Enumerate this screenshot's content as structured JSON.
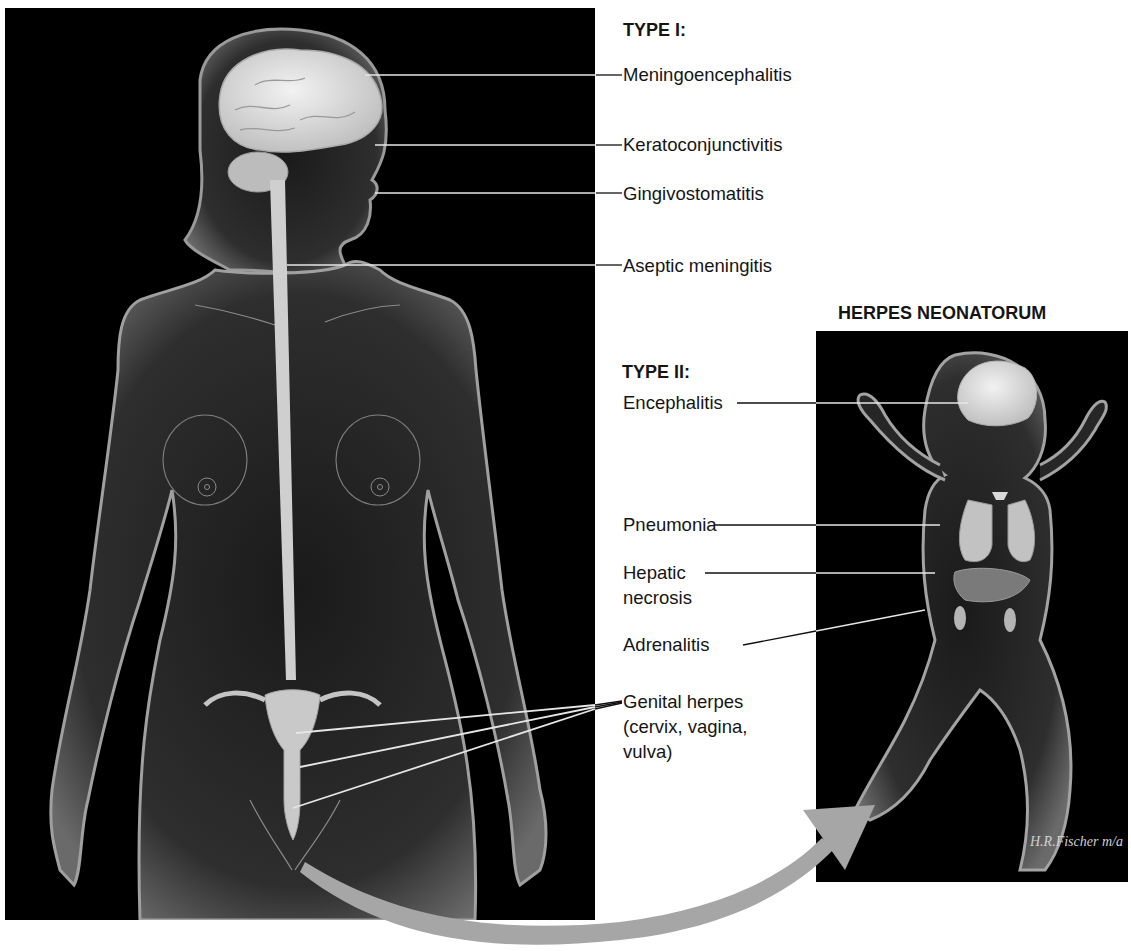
{
  "figure": {
    "type1": {
      "heading": "TYPE I:",
      "labels": [
        "Meningoencephalitis",
        "Keratoconjunctivitis",
        "Gingivostomatitis",
        "Aseptic meningitis"
      ]
    },
    "neonatorum_title": "HERPES NEONATORUM",
    "type2": {
      "heading": "TYPE II:",
      "labels": {
        "encephalitis": "Encephalitis",
        "pneumonia": "Pneumonia",
        "hepatic_line1": "Hepatic",
        "hepatic_line2": "necrosis",
        "adrenalitis": "Adrenalitis"
      }
    },
    "genital": {
      "line1": "Genital herpes",
      "line2": "(cervix, vagina,",
      "line3": "vulva)"
    },
    "signature": "H.R.Fischer m/a",
    "colors": {
      "panel_background": "#000000",
      "body_glow": "#bfbfbf",
      "organ_fill": "#d9d9d9",
      "arrow": "#a6a6a6",
      "leader_line_on_panel": "#e6e6e6",
      "leader_line_on_white": "#111111"
    }
  }
}
